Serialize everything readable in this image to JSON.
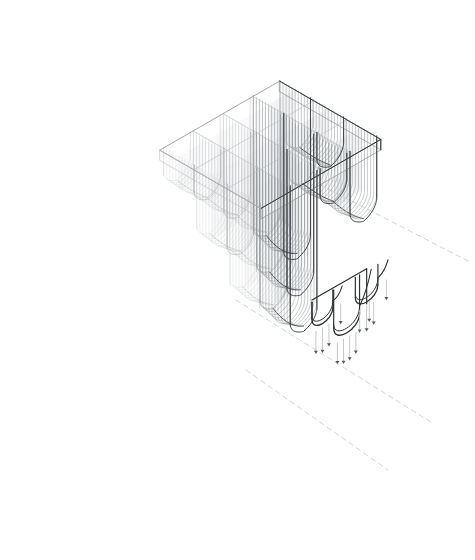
{
  "canvas": {
    "width": 475,
    "height": 560,
    "background": "#ffffff",
    "title": "Axonometric projection of a ribbed vault ceiling system with enlarged detail"
  },
  "palette": {
    "hidden_line": "#c9cbcd",
    "faint_line": "#b9bcbf",
    "mid_line": "#8d9194",
    "strong_line": "#3a3d40",
    "detail_line": "#2f3134",
    "leader_dash": "#d3d5d7",
    "arrow_shaft": "#bfc1c3",
    "arrow_head": "#55585b",
    "surface_tint": "#e8eaec",
    "surface_tint_soft": "#f2f3f4"
  },
  "axonometric": {
    "label": "main-axonometric-volume",
    "projection": "isometric",
    "origin": {
      "x": 160,
      "y": 150
    },
    "axis_u": {
      "dx": 9.2,
      "dy": -5.3
    },
    "axis_v": {
      "dx": 9.2,
      "dy": 5.3
    },
    "axis_w": {
      "dx": 0,
      "dy": 10.5
    },
    "extent_u": 13,
    "extent_v": 11,
    "slab_thickness": 1.0,
    "bay_pitch_u": 3.25,
    "bay_pitch_v": 3.6,
    "bay_count_u": 4,
    "bay_count_v": 3,
    "vault_depth_levels": [
      4.0,
      7.4,
      10.8,
      14.6
    ],
    "rib_count_per_bay": 11,
    "vault_half_width": 1.45,
    "description": "Rectangular slab volume with pendant fluted vault lobes descending from its underside in a staggered grid"
  },
  "detail": {
    "label": "enlarged-detail-view",
    "origin": {
      "x": 312,
      "y": 300
    },
    "scale": 2.35,
    "slab_top_line": "top edge of enlarged slab fragment",
    "lobes": [
      {
        "id": "lobe-left",
        "offset_u": 0.0,
        "depth": 3.9,
        "half_width": 1.25
      },
      {
        "id": "lobe-center",
        "offset_u": 2.6,
        "depth": 7.1,
        "half_width": 1.55
      },
      {
        "id": "lobe-right",
        "offset_u": 5.2,
        "depth": 4.4,
        "half_width": 1.35
      }
    ],
    "arrow_groups": [
      {
        "group": "left-upper",
        "count": 3
      },
      {
        "group": "left-lower",
        "count": 1
      },
      {
        "group": "center",
        "count": 4
      },
      {
        "group": "right-upper",
        "count": 3
      },
      {
        "group": "right-lower",
        "count": 2
      }
    ],
    "arrow_meaning": "downward flow / drainage direction indicators"
  },
  "leaders": [
    {
      "id": "leader-upper",
      "from": {
        "x": 272,
        "y": 160
      },
      "to": {
        "x": 470,
        "y": 262
      },
      "style": "dashed"
    },
    {
      "id": "leader-lower",
      "from": {
        "x": 236,
        "y": 300
      },
      "to": {
        "x": 434,
        "y": 424
      },
      "style": "dashed"
    },
    {
      "id": "leader-bottom",
      "from": {
        "x": 246,
        "y": 370
      },
      "to": {
        "x": 388,
        "y": 470
      },
      "style": "dashed"
    }
  ]
}
